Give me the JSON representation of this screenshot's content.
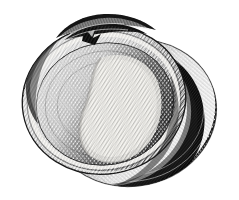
{
  "document": {
    "background_color": "#ffffff",
    "ink_color": "#1b1b1b",
    "medium": "engraving-halftone",
    "title": "Bivalve shell engraving",
    "width": 239,
    "height": 200
  },
  "figure": {
    "name": "bivalve-shell-pair",
    "description": "Monochrome cross-hatched engraving of a bivalve shell: a large open valve shown interior-up in front, with a second valve behind it offset to the lower right.",
    "subjects": [
      {
        "id": "rear-valve",
        "label": "Rear valve",
        "tone": "dark",
        "center": [
          132,
          112
        ],
        "radius_x": 84,
        "radius_y": 74,
        "rotation_deg": -12,
        "fill_color": "#2b2b2b"
      },
      {
        "id": "front-valve",
        "label": "Front valve",
        "tone": "mid",
        "center": [
          104,
          100
        ],
        "radius_x": 82,
        "radius_y": 74,
        "rotation_deg": -10,
        "fill_color": "#6a6a6a"
      },
      {
        "id": "inner-cavity",
        "label": "Interior cavity",
        "tone": "dark",
        "center": [
          104,
          103
        ],
        "radius_x": 70,
        "radius_y": 62,
        "rotation_deg": -10,
        "fill_color": "#3a3a3a"
      },
      {
        "id": "nacre-highlight",
        "label": "Nacre highlight",
        "tone": "light",
        "fill_color": "#eceae4"
      },
      {
        "id": "hinge",
        "label": "Hinge / umbo",
        "tone": "dark",
        "center": [
          95,
          26
        ],
        "fill_color": "#1a1a1a"
      },
      {
        "id": "rim-highlight",
        "label": "Rim highlight",
        "tone": "light",
        "fill_color": "#f2f0eb"
      },
      {
        "id": "cast-shadow",
        "label": "Cast shadow",
        "tone": "darkest",
        "fill_color": "#232323"
      }
    ],
    "hatching": {
      "label": "Cross-hatch engraving lines",
      "line_color": "#111111",
      "spacing_px": 2,
      "angles_deg": [
        38,
        -38
      ]
    }
  }
}
